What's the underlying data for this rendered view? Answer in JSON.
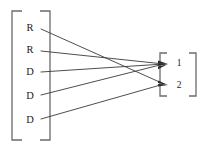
{
  "diagram": {
    "type": "bipartite-mapping",
    "left_group": {
      "bracket": "square-bracket-left",
      "items": [
        {
          "label": "R",
          "id": "left-1",
          "x": 30,
          "y": 28
        },
        {
          "label": "R",
          "id": "left-2",
          "x": 30,
          "y": 50
        },
        {
          "label": "D",
          "id": "left-3",
          "x": 30,
          "y": 72
        },
        {
          "label": "D",
          "id": "left-4",
          "x": 30,
          "y": 96
        },
        {
          "label": "D",
          "id": "left-5",
          "x": 30,
          "y": 120
        }
      ]
    },
    "right_group": {
      "bracket": "square-bracket-right",
      "items": [
        {
          "label": "1",
          "id": "right-1",
          "x": 180,
          "y": 64
        },
        {
          "label": "2",
          "id": "right-2",
          "x": 180,
          "y": 86
        }
      ]
    },
    "edges": [
      {
        "from": "left-1",
        "to": "right-2",
        "x1": 41,
        "y1": 29,
        "x2": 168,
        "y2": 85
      },
      {
        "from": "left-2",
        "to": "right-1",
        "x1": 41,
        "y1": 51,
        "x2": 168,
        "y2": 64
      },
      {
        "from": "left-3",
        "to": "right-1",
        "x1": 41,
        "y1": 72,
        "x2": 168,
        "y2": 64
      },
      {
        "from": "left-4",
        "to": "right-1",
        "x1": 41,
        "y1": 95,
        "x2": 168,
        "y2": 64
      },
      {
        "from": "left-5",
        "to": "right-2",
        "x1": 41,
        "y1": 119,
        "x2": 168,
        "y2": 85
      }
    ],
    "colors": {
      "bracket": "#6b6b6b",
      "edge": "#3a3a3a",
      "arrow": "#2b2b2b",
      "label": "#1b1b1b",
      "background": "#ffffff"
    }
  }
}
